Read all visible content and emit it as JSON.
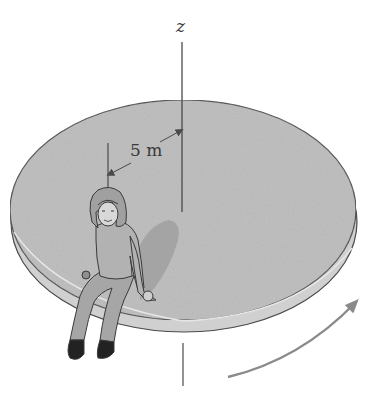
{
  "figure": {
    "axis_label": "z",
    "radius_label": "5 m"
  },
  "colors": {
    "disc_top": "#bdbdbd",
    "disc_edge": "#d2d2d2",
    "outline": "#4a4a4a",
    "shadow": "#9a9a9a",
    "arrow": "#8a8a8a",
    "background": "#ffffff"
  },
  "icons": {
    "rotation_arrow": "curved-arrow-icon",
    "person": "girl-figure-icon"
  }
}
